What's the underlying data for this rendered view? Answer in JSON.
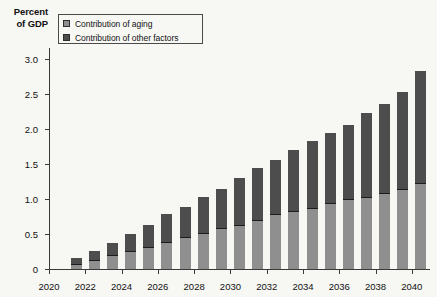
{
  "axis_title": {
    "line1": "Percent",
    "line2": "of GDP"
  },
  "legend": {
    "position": "top-left-inside",
    "items": [
      {
        "label": "Contribution of aging",
        "color": "#8f8f8f",
        "swatch_name": "legend-swatch-aging"
      },
      {
        "label": "Contribution of other factors",
        "color": "#4d4d4d",
        "swatch_name": "legend-swatch-other"
      }
    ]
  },
  "chart_data": {
    "type": "bar",
    "subtype": "stacked-vertical",
    "title": "",
    "subtitle": "",
    "xlabel": "",
    "ylabel": "Percent of GDP",
    "ylim": [
      0,
      3.15
    ],
    "ytick_labels": [
      "0",
      "0.5",
      "1.0",
      "1.5",
      "2.0",
      "2.5",
      "3.0"
    ],
    "ytick_values": [
      0,
      0.5,
      1.0,
      1.5,
      2.0,
      2.5,
      3.0
    ],
    "xtick_labels": [
      "2020",
      "2022",
      "2024",
      "2026",
      "2028",
      "2030",
      "2032",
      "2034",
      "2036",
      "2038",
      "2040"
    ],
    "xtick_values": [
      2020,
      2022,
      2024,
      2026,
      2028,
      2030,
      2032,
      2034,
      2036,
      2038,
      2040
    ],
    "xlim": [
      2020,
      2041
    ],
    "grid": false,
    "categories": [
      2021,
      2022,
      2023,
      2024,
      2025,
      2026,
      2027,
      2028,
      2029,
      2030,
      2031,
      2032,
      2033,
      2034,
      2035,
      2036,
      2037,
      2038,
      2039,
      2040
    ],
    "series": [
      {
        "name": "Contribution of aging",
        "color": "#8f8f8f",
        "values": [
          0.07,
          0.13,
          0.2,
          0.26,
          0.32,
          0.38,
          0.45,
          0.52,
          0.58,
          0.63,
          0.7,
          0.78,
          0.82,
          0.87,
          0.94,
          1.0,
          1.03,
          1.08,
          1.14,
          1.22
        ]
      },
      {
        "name": "Contribution of other factors",
        "color": "#4d4d4d",
        "values": [
          0.08,
          0.12,
          0.17,
          0.24,
          0.31,
          0.4,
          0.44,
          0.5,
          0.56,
          0.67,
          0.74,
          0.77,
          0.88,
          0.96,
          1.0,
          1.05,
          1.2,
          1.27,
          1.38,
          1.6
        ]
      }
    ],
    "totals": [
      0.15,
      0.25,
      0.37,
      0.5,
      0.63,
      0.78,
      0.89,
      1.02,
      1.14,
      1.3,
      1.44,
      1.55,
      1.7,
      1.83,
      1.94,
      2.05,
      2.23,
      2.35,
      2.52,
      2.82
    ]
  }
}
